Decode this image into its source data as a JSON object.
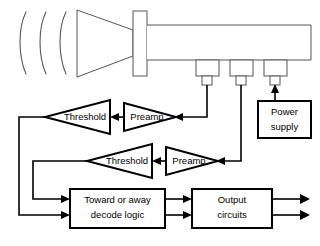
{
  "diagram": {
    "antenna": {
      "horn_name": "horn-antenna",
      "flange_name": "waveguide-flange",
      "waveguide_name": "waveguide",
      "wave_count": 3,
      "wave_label": "incoming-microwave-arcs"
    },
    "probes": [
      {
        "label": "probe-1"
      },
      {
        "label": "probe-2"
      },
      {
        "label": "probe-3"
      }
    ],
    "blocks": [
      {
        "id": "power-supply",
        "lines": [
          "Power",
          "supply"
        ]
      },
      {
        "id": "decode-logic",
        "lines": [
          "Toward or away",
          "decode logic"
        ]
      },
      {
        "id": "output-circuits",
        "lines": [
          "Output",
          "circuits"
        ]
      }
    ],
    "amplifiers": [
      {
        "id": "threshold-upper",
        "label": "Threshold"
      },
      {
        "id": "preamp-upper",
        "label": "Preamp"
      },
      {
        "id": "threshold-lower",
        "label": "Threshold"
      },
      {
        "id": "preamp-lower",
        "label": "Preamp"
      }
    ],
    "colors": {
      "background": "#ffffff",
      "heavy_line": "#000000",
      "thin_line": "#555555",
      "text": "#000000"
    }
  }
}
